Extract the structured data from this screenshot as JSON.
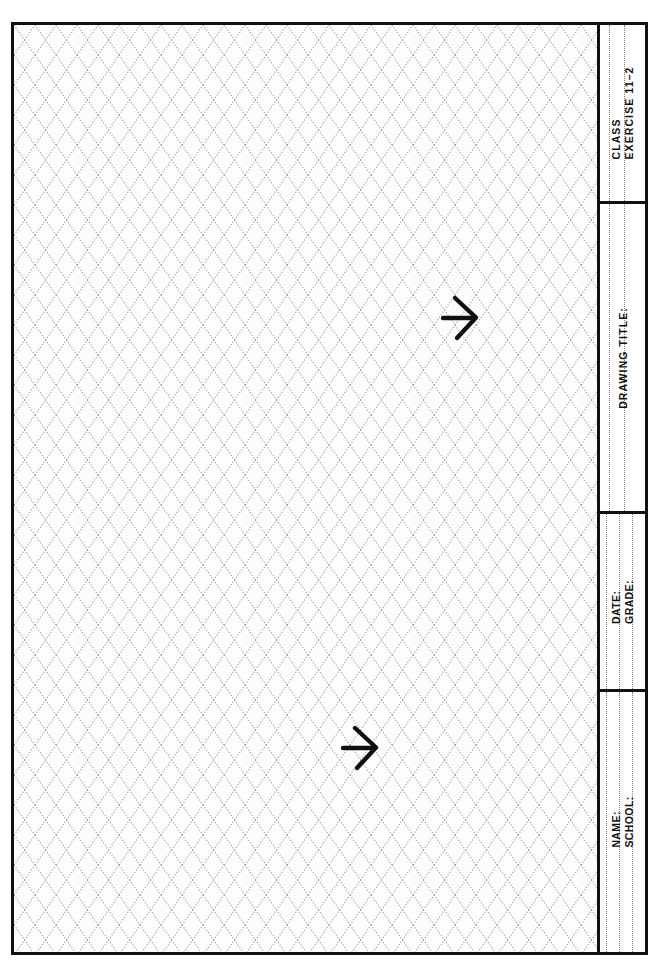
{
  "sheet": {
    "kind": "technical-drawing-worksheet",
    "orientation": "landscape-grid-with-vertical-title-block",
    "grid_type": "isometric-diamond-dotted",
    "paper_color": "#fdfdfd",
    "ink_color": "#111111",
    "grid_dot_color": "#9a9a9a"
  },
  "title_block": {
    "sections": [
      {
        "id": "class",
        "labels": [
          "CLASS",
          "EXERCISE 11–2"
        ],
        "guide_lines": 2
      },
      {
        "id": "drawing-title",
        "labels": [
          "DRAWING TITLE:"
        ],
        "guide_lines": 2
      },
      {
        "id": "date-grade",
        "labels": [
          "DATE:",
          "GRADE:"
        ],
        "guide_lines": 3
      },
      {
        "id": "name-school",
        "labels": [
          "NAME:",
          "SCHOOL:"
        ],
        "guide_lines": 3
      }
    ]
  },
  "annotations": {
    "marks": [
      {
        "id": "arrow-upper",
        "type": "arrow",
        "direction": "right",
        "x": 428,
        "y": 272
      },
      {
        "id": "arrow-lower",
        "type": "arrow",
        "direction": "right",
        "x": 328,
        "y": 702
      }
    ]
  },
  "footer": {
    "caption": ""
  }
}
